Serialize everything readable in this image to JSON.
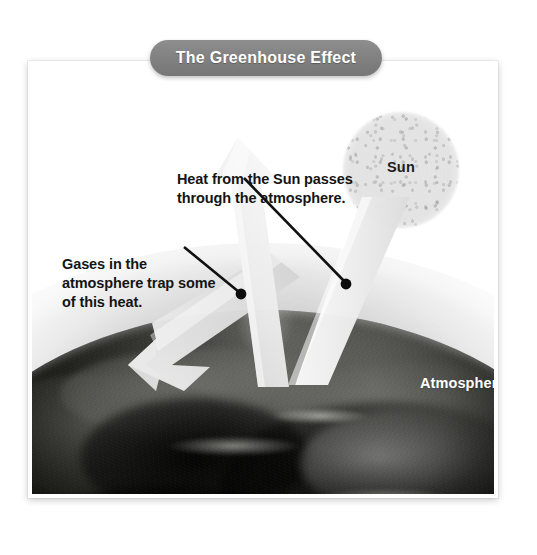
{
  "title": {
    "text": "The Greenhouse Effect",
    "pill_color": "#828282",
    "text_color": "#ffffff"
  },
  "figure": {
    "callouts": [
      {
        "id": "heat-from-sun",
        "text": "Heat from the Sun passes through the atmosphere."
      },
      {
        "id": "gases-trap-heat",
        "text": "Gases in the atmosphere trap some of this heat."
      }
    ],
    "labels": {
      "sun": "Sun",
      "atmosphere": "Atmosphere"
    },
    "arrows": [
      {
        "id": "incoming-solar-beam",
        "description": "Wide pale beam descending from the Sun through the atmosphere to the Earth's surface"
      },
      {
        "id": "outgoing-heat-arrow",
        "description": "Pale arrow rising up and to the left, escaping the atmosphere"
      },
      {
        "id": "trapped-heat-arrow",
        "description": "Pale arrow bending back toward the left, trapped within the atmosphere"
      }
    ],
    "colors": {
      "background": "#ffffff",
      "earth_dark": "#0d0d0b",
      "atmosphere_gray": "#9a9a9a",
      "arrow_fill": "#e6e6e6",
      "sun_gray": "#cccccc",
      "callout_text": "#141414",
      "leader_line": "#101010"
    }
  }
}
